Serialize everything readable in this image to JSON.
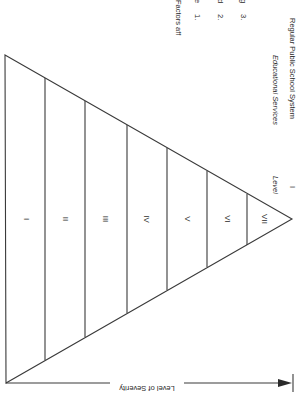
{
  "diagram": {
    "factors": {
      "heading": "Factors aff",
      "items": [
        {
          "number": "1.",
          "text": "Se"
        },
        {
          "number": "2.",
          "text": "Ed"
        },
        {
          "number": "3.",
          "text": "Ag"
        }
      ]
    },
    "services_header": "Educational Services",
    "services_value": "Regular Public School System",
    "level_header": "Level",
    "level_value": "I",
    "levels": [
      "I",
      "II",
      "III",
      "IV",
      "V",
      "VI",
      "VII"
    ],
    "axis_label": "Level of Severity",
    "colors": {
      "line": "#3a3a3a",
      "text": "#2a2a2a",
      "background": "#ffffff"
    }
  }
}
